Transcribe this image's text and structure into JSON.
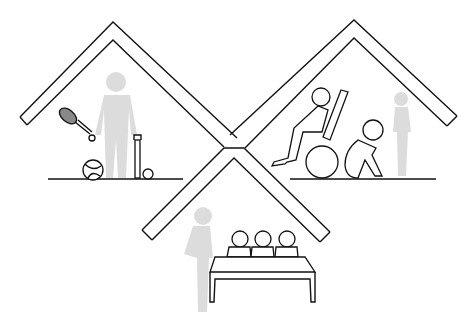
{
  "illustration": {
    "title": "",
    "description": "Three overlapping house-roof shapes forming an X, each sheltering a scene",
    "colors": {
      "line": "#111111",
      "ghost_figure": "#dcdcdc",
      "background": "#ffffff"
    },
    "scenes": [
      {
        "id": "left-house",
        "label": "sports / leisure",
        "items": [
          "standing-ghost-figure",
          "tennis-racket",
          "ball",
          "cricket-bat",
          "small-ball",
          "ground-line"
        ]
      },
      {
        "id": "right-house",
        "label": "care / disability",
        "items": [
          "person-in-wheelchair",
          "seated-hunched-person",
          "standing-ghost-figure",
          "ground-line"
        ]
      },
      {
        "id": "bottom-house",
        "label": "panel / interview",
        "items": [
          "standing-ghost-figure",
          "three-seated-people",
          "table"
        ]
      }
    ]
  }
}
